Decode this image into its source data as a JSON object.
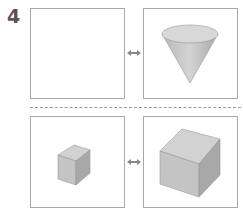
{
  "problem": {
    "number": "4",
    "rows": [
      {
        "left": "empty",
        "right": "cone",
        "connector": "double-arrow"
      },
      {
        "left": "small-cube",
        "right": "large-cube",
        "connector": "double-arrow"
      }
    ],
    "colors": {
      "border": "#a8a8a8",
      "shape_fill": "#c8c8c8",
      "arrow": "#888888",
      "number": "#555555"
    }
  }
}
